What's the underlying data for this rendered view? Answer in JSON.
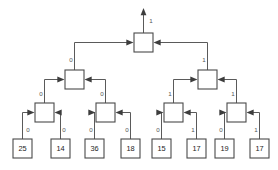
{
  "diagram": {
    "type": "binary-tournament-tree",
    "canvas": {
      "width": 278,
      "height": 170
    },
    "colors": {
      "background": "#ffffff",
      "box_fill": "#ffffff",
      "box_stroke": "#4a4a4a",
      "edge_stroke": "#5a5a5a",
      "arrow_fill": "#3d3d3d",
      "edge_label_text": "#555555",
      "leaf_label_text": "#1c1c1c"
    },
    "output_edge": {
      "label": "1",
      "direction": "up"
    },
    "levels": [
      {
        "name": "root",
        "depth": 0,
        "nodes": [
          {
            "id": "root",
            "label": "",
            "x": 134,
            "y": 33,
            "w": 19,
            "h": 19
          }
        ]
      },
      {
        "name": "level-1",
        "depth": 1,
        "nodes": [
          {
            "id": "n1-left",
            "label": "",
            "x": 65,
            "y": 70,
            "w": 19,
            "h": 19
          },
          {
            "id": "n1-right",
            "label": "",
            "x": 198,
            "y": 70,
            "w": 19,
            "h": 19
          }
        ]
      },
      {
        "name": "level-2",
        "depth": 2,
        "nodes": [
          {
            "id": "n2-a",
            "label": "",
            "x": 35,
            "y": 103,
            "w": 19,
            "h": 19
          },
          {
            "id": "n2-b",
            "label": "",
            "x": 96,
            "y": 103,
            "w": 19,
            "h": 19
          },
          {
            "id": "n2-c",
            "label": "",
            "x": 164,
            "y": 103,
            "w": 19,
            "h": 19
          },
          {
            "id": "n2-d",
            "label": "",
            "x": 227,
            "y": 103,
            "w": 19,
            "h": 19
          }
        ]
      },
      {
        "name": "leaves",
        "depth": 3,
        "nodes": [
          {
            "id": "leaf-0",
            "label": "25",
            "x": 13,
            "y": 139,
            "w": 19,
            "h": 19
          },
          {
            "id": "leaf-1",
            "label": "14",
            "x": 51,
            "y": 139,
            "w": 19,
            "h": 19
          },
          {
            "id": "leaf-2",
            "label": "36",
            "x": 85,
            "y": 139,
            "w": 19,
            "h": 19
          },
          {
            "id": "leaf-3",
            "label": "18",
            "x": 121,
            "y": 139,
            "w": 19,
            "h": 19
          },
          {
            "id": "leaf-4",
            "label": "15",
            "x": 152,
            "y": 139,
            "w": 19,
            "h": 19
          },
          {
            "id": "leaf-5",
            "label": "17",
            "x": 187,
            "y": 139,
            "w": 19,
            "h": 19
          },
          {
            "id": "leaf-6",
            "label": "19",
            "x": 215,
            "y": 139,
            "w": 19,
            "h": 19
          },
          {
            "id": "leaf-7",
            "label": "17",
            "x": 250,
            "y": 139,
            "w": 19,
            "h": 19
          }
        ]
      }
    ],
    "edges": [
      {
        "id": "e-root-left",
        "from": "n1-left",
        "to": "root",
        "label": "0",
        "label_x": 71,
        "label_y": 60
      },
      {
        "id": "e-root-right",
        "from": "n1-right",
        "to": "root",
        "label": "1",
        "label_x": 204,
        "label_y": 60
      },
      {
        "id": "e-l1l-a",
        "from": "n2-a",
        "to": "n1-left",
        "label": "0",
        "label_x": 41,
        "label_y": 94
      },
      {
        "id": "e-l1l-b",
        "from": "n2-b",
        "to": "n1-left",
        "label": "0",
        "label_x": 102,
        "label_y": 94
      },
      {
        "id": "e-l1r-c",
        "from": "n2-c",
        "to": "n1-right",
        "label": "1",
        "label_x": 170,
        "label_y": 94
      },
      {
        "id": "e-l1r-d",
        "from": "n2-d",
        "to": "n1-right",
        "label": "1",
        "label_x": 233,
        "label_y": 94
      },
      {
        "id": "e-a-0",
        "from": "leaf-0",
        "to": "n2-a",
        "label": "0",
        "label_x": 28,
        "label_y": 130
      },
      {
        "id": "e-a-1",
        "from": "leaf-1",
        "to": "n2-a",
        "label": "0",
        "label_x": 61,
        "label_y": 130
      },
      {
        "id": "e-b-2",
        "from": "leaf-2",
        "to": "n2-b",
        "label": "0",
        "label_x": 90,
        "label_y": 130
      },
      {
        "id": "e-b-3",
        "from": "leaf-3",
        "to": "n2-b",
        "label": "0",
        "label_x": 124,
        "label_y": 130
      },
      {
        "id": "e-c-4",
        "from": "leaf-4",
        "to": "n2-c",
        "label": "0",
        "label_x": 157,
        "label_y": 130
      },
      {
        "id": "e-c-5",
        "from": "leaf-5",
        "to": "n2-c",
        "label": "1",
        "label_x": 190,
        "label_y": 130
      },
      {
        "id": "e-d-6",
        "from": "leaf-6",
        "to": "n2-d",
        "label": "0",
        "label_x": 221,
        "label_y": 130
      },
      {
        "id": "e-d-7",
        "from": "leaf-7",
        "to": "n2-d",
        "label": "1",
        "label_x": 253,
        "label_y": 130
      }
    ]
  }
}
